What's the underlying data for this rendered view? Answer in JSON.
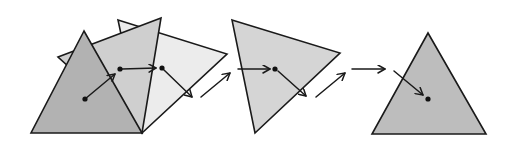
{
  "diagram": {
    "title": "",
    "colors": {
      "stroke": "#1a1a1a",
      "tri_dark": "#b2b2b2",
      "tri_medium": "#cfcfcf",
      "tri_light": "#ececec",
      "tri_second": "#d5d5d5",
      "tri_final": "#bdbdbd",
      "background": "#ffffff"
    },
    "stages": [
      {
        "id": "stage-1",
        "triangles": [
          {
            "name": "light-triangle",
            "points": "118,20 227,54 142,133",
            "fill": "#ececec"
          },
          {
            "name": "medium-triangle",
            "points": "58,57 161,18 142,133",
            "fill": "#cfcfcf"
          },
          {
            "name": "dark-triangle",
            "points": "84,31 31,133 142,133",
            "fill": "#b2b2b2"
          }
        ],
        "dots": [
          {
            "name": "point-start",
            "x": 85,
            "y": 99
          },
          {
            "name": "point-mid",
            "x": 120,
            "y": 69
          },
          {
            "name": "point-end",
            "x": 162,
            "y": 68
          }
        ],
        "arrows": [
          {
            "name": "arrow-rotate-1",
            "x1": 85,
            "y1": 99,
            "x2": 115,
            "y2": 74
          },
          {
            "name": "arrow-rotate-2",
            "x1": 122,
            "y1": 69,
            "x2": 156,
            "y2": 68
          },
          {
            "name": "arrow-rotate-3",
            "x1": 164,
            "y1": 70,
            "x2": 192,
            "y2": 97
          }
        ]
      },
      {
        "id": "transition-1",
        "arrows": [
          {
            "name": "arrow-transition-1",
            "x1": 201,
            "y1": 97,
            "x2": 230,
            "y2": 73
          }
        ]
      },
      {
        "id": "stage-2",
        "triangles": [
          {
            "name": "second-triangle",
            "points": "232,20 340,53 255,133",
            "fill": "#d5d5d5"
          }
        ],
        "dots": [
          {
            "name": "point-second",
            "x": 275,
            "y": 69
          }
        ],
        "arrows": [
          {
            "name": "arrow-into-second",
            "x1": 238,
            "y1": 69,
            "x2": 270,
            "y2": 69
          },
          {
            "name": "arrow-out-second",
            "x1": 278,
            "y1": 71,
            "x2": 306,
            "y2": 96
          }
        ]
      },
      {
        "id": "transition-2",
        "arrows": [
          {
            "name": "arrow-transition-2",
            "x1": 316,
            "y1": 97,
            "x2": 345,
            "y2": 73
          },
          {
            "name": "arrow-horizontal-final",
            "x1": 352,
            "y1": 69,
            "x2": 385,
            "y2": 69
          }
        ]
      },
      {
        "id": "stage-3",
        "triangles": [
          {
            "name": "final-triangle",
            "points": "428,33 372,134 486,134",
            "fill": "#bdbdbd"
          }
        ],
        "dots": [
          {
            "name": "point-final",
            "x": 428,
            "y": 99
          }
        ],
        "arrows": [
          {
            "name": "arrow-into-final",
            "x1": 394,
            "y1": 71,
            "x2": 423,
            "y2": 95
          }
        ]
      }
    ]
  }
}
